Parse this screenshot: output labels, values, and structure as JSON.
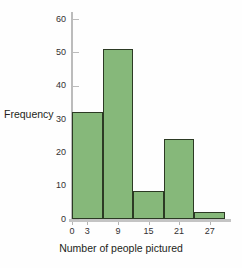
{
  "chart_data": {
    "type": "bar",
    "title": "",
    "subtitle": "",
    "xlabel": "Number of people pictured",
    "ylabel": "Frequency",
    "xlim": [
      0,
      30
    ],
    "ylim": [
      0,
      60
    ],
    "grid": false,
    "legend": "none",
    "bar_color": "#86b87a",
    "bar_edge_color": "#2c3a24",
    "axis_color": "#bcbcbc",
    "bin_width": 6,
    "bin_edges": [
      0,
      6,
      12,
      18,
      24,
      30
    ],
    "categories": [
      "0-6",
      "6-12",
      "12-18",
      "18-24",
      "24-30"
    ],
    "values": [
      32,
      51,
      8.5,
      24,
      2
    ],
    "xticks": [
      0,
      3,
      9,
      15,
      21,
      27
    ],
    "xtick_labels": [
      "0",
      "3",
      "9",
      "15",
      "21",
      "27"
    ],
    "yticks": [
      0,
      10,
      20,
      30,
      40,
      50,
      60
    ],
    "ytick_labels": [
      "0",
      "10",
      "20",
      "30",
      "40",
      "50",
      "60"
    ],
    "annotations": []
  }
}
